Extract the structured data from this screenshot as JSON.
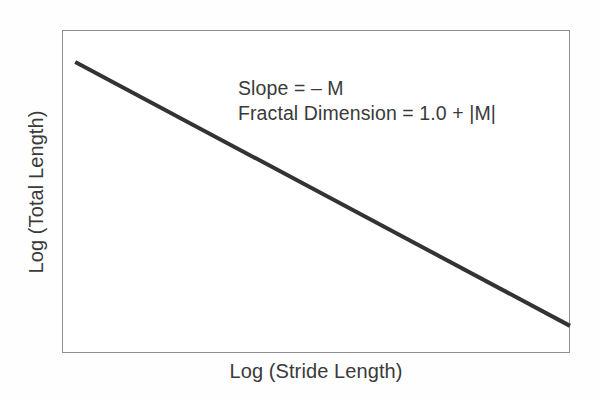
{
  "figure": {
    "background_color": "#fefefe",
    "plot_background_color": "#ffffff",
    "frame_color": "#8e8e8e",
    "line_color": "#333333",
    "text_color": "#3a3a3a"
  },
  "axes": {
    "x_label": "Log (Stride Length)",
    "y_label": "Log (Total Length)"
  },
  "annotation": {
    "line1": "Slope = – M",
    "line2": "Fractal Dimension = 1.0 + |M|"
  },
  "chart_data": {
    "type": "line",
    "title": "",
    "xlabel": "Log (Stride Length)",
    "ylabel": "Log (Total Length)",
    "xlim": [
      0,
      1
    ],
    "ylim": [
      0,
      1
    ],
    "grid": false,
    "legend": "none",
    "axis_ticks": "none",
    "series": [
      {
        "name": "Richardson plot (log-log regression line)",
        "x": [
          0.026,
          1.0
        ],
        "y": [
          0.901,
          0.084
        ],
        "style": "solid",
        "color": "#333333",
        "width_px": 4,
        "slope": -0.838,
        "description": "Straight descending line representing negative log-log slope"
      }
    ],
    "annotations": [
      {
        "text": "Slope = – M",
        "x": 0.346,
        "y": 0.745
      },
      {
        "text": "Fractal Dimension = 1.0 + |M|",
        "x": 0.346,
        "y": 0.668
      }
    ]
  }
}
